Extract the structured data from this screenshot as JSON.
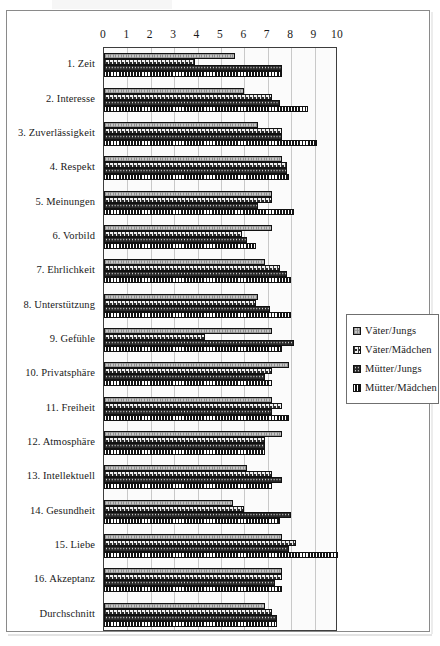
{
  "chart_data": {
    "type": "bar",
    "orientation": "horizontal",
    "title": "",
    "xlabel": "",
    "ylabel": "",
    "xlim": [
      0,
      10
    ],
    "grid": true,
    "legend_position": "right",
    "xticks": [
      "0",
      "1",
      "2",
      "3",
      "4",
      "5",
      "6",
      "7",
      "8",
      "9",
      "10"
    ],
    "categories": [
      "1. Zeit",
      "2. Interesse",
      "3. Zuverlässigkeit",
      "4. Respekt",
      "5. Meinungen",
      "6. Vorbild",
      "7. Ehrlichkeit",
      "8. Unterstützung",
      "9. Gefühle",
      "10. Privatsphäre",
      "11. Freiheit",
      "12. Atmosphäre",
      "13. Intellektuell",
      "14. Gesundheit",
      "15. Liebe",
      "16. Akzeptanz",
      "Durchschnitt"
    ],
    "series": [
      {
        "name": "Väter/Jungs",
        "pattern": "light-grey-hatch",
        "color": "#c5c5c5",
        "values": [
          5.6,
          6.0,
          6.6,
          7.6,
          7.2,
          7.2,
          6.9,
          6.6,
          7.2,
          7.9,
          7.2,
          7.6,
          6.1,
          5.5,
          7.6,
          7.6,
          6.9
        ]
      },
      {
        "name": "Väter/Mädchen",
        "pattern": "white-scallop",
        "color": "#efefef",
        "values": [
          3.9,
          7.2,
          7.6,
          7.8,
          7.2,
          5.9,
          7.5,
          6.5,
          4.3,
          7.2,
          7.6,
          6.9,
          7.2,
          6.0,
          8.2,
          7.6,
          7.2
        ]
      },
      {
        "name": "Mütter/Jungs",
        "pattern": "dark-dotted",
        "color": "#272727",
        "values": [
          7.6,
          7.5,
          7.6,
          7.8,
          6.6,
          6.1,
          7.8,
          7.1,
          8.1,
          6.9,
          7.2,
          6.9,
          7.6,
          8.0,
          7.9,
          7.3,
          7.4
        ]
      },
      {
        "name": "Mütter/Mädchen",
        "pattern": "black-vertical-bands",
        "color": "#1a1a1a",
        "values": [
          7.6,
          8.7,
          9.1,
          7.9,
          8.1,
          6.5,
          8.0,
          8.0,
          7.6,
          7.2,
          7.9,
          6.9,
          7.2,
          7.5,
          10.0,
          7.6,
          7.4
        ]
      }
    ]
  },
  "legend": {
    "items": [
      {
        "label": "Väter/Jungs"
      },
      {
        "label": "Väter/Mädchen"
      },
      {
        "label": "Mütter/Jungs"
      },
      {
        "label": "Mütter/Mädchen"
      }
    ]
  },
  "colors": {
    "frame": "#8a8a8a",
    "axis": "#3d3d3d",
    "gridline": "#c9c9c9",
    "plot_background": "#fbfbfb",
    "text": "#1a1a1a"
  }
}
